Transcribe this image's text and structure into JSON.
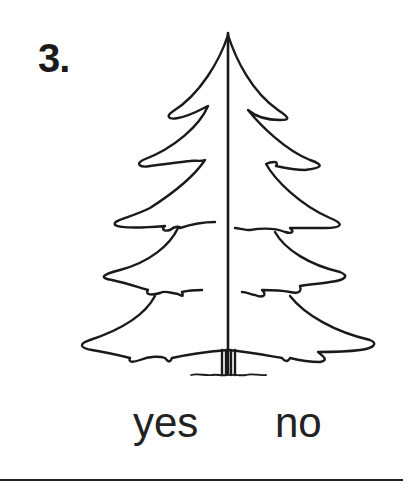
{
  "question": {
    "number": "3.",
    "image": "pine-tree-icon",
    "options": [
      {
        "label": "yes"
      },
      {
        "label": "no"
      }
    ]
  },
  "colors": {
    "ink": "#1a1a1a",
    "background": "#ffffff"
  }
}
